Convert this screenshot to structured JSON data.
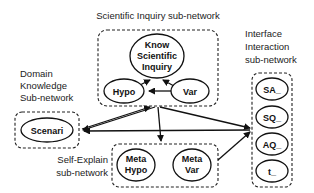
{
  "groups": {
    "scientific_inquiry": {
      "label": "Scientific Inquiry sub-network"
    },
    "domain_knowledge": {
      "label_lines": [
        "Domain",
        "Knowledge",
        "Sub-network"
      ]
    },
    "self_explain": {
      "label_lines": [
        "Self-Explain",
        "sub-network"
      ]
    },
    "interface_interaction": {
      "label_lines": [
        "Interface",
        "Interaction",
        "sub-network"
      ]
    }
  },
  "nodes": {
    "know_scientific_inquiry": {
      "lines": [
        "Know",
        "Scientific",
        "Inquiry"
      ]
    },
    "hypo": {
      "label": "Hypo"
    },
    "var": {
      "label": "Var"
    },
    "scenari": {
      "label": "Scenari"
    },
    "meta_hypo": {
      "lines": [
        "Meta",
        "Hypo"
      ]
    },
    "meta_var": {
      "lines": [
        "Meta",
        "Var"
      ]
    },
    "sa": {
      "label": "SA_"
    },
    "sq": {
      "label": "SQ_"
    },
    "aq": {
      "label": "AQ_"
    },
    "t": {
      "label": "t_"
    }
  },
  "edges": [
    {
      "from": "Hypo",
      "to": "Know Scientific Inquiry"
    },
    {
      "from": "Var",
      "to": "Know Scientific Inquiry"
    },
    {
      "from": "Var",
      "to": "Hypo"
    },
    {
      "from": "Scientific Inquiry sub-network",
      "to": "Domain Knowledge Sub-network"
    },
    {
      "from": "Scientific Inquiry sub-network",
      "to": "Self-Explain sub-network"
    },
    {
      "from": "Scientific Inquiry sub-network",
      "to": "Interface Interaction sub-network"
    },
    {
      "from": "Interface Interaction sub-network",
      "to": "Domain Knowledge Sub-network"
    },
    {
      "from": "Self-Explain sub-network",
      "to": "Interface Interaction sub-network"
    },
    {
      "from": "Domain Knowledge Sub-network",
      "to": "Scientific Inquiry sub-network"
    }
  ]
}
